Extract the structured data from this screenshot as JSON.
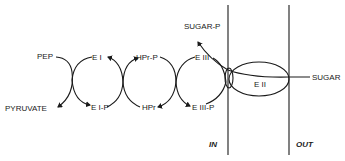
{
  "diagram": {
    "cycles": [
      {
        "top_left": "PEP",
        "bottom_left": "PYRUVATE"
      },
      {
        "top": "E I",
        "bottom": "E I-P"
      },
      {
        "top": "HPr-P",
        "bottom": "HPr"
      },
      {
        "top": "E III",
        "bottom": "E III-P"
      }
    ],
    "labels": {
      "pep": "PEP",
      "pyruvate": "PYRUVATE",
      "ei": "E I",
      "eip": "E I-P",
      "hprp": "HPr-P",
      "hpr": "HPr",
      "eiii": "E III",
      "eiiip": "E III-P",
      "sugar_p": "SUGAR-P",
      "sugar": "SUGAR",
      "eii": "E II",
      "in": "IN",
      "out": "OUT"
    },
    "colors": {
      "ink": "#1a1a1a",
      "background": "#ffffff"
    }
  }
}
